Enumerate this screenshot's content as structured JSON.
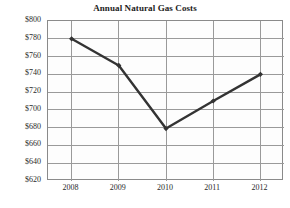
{
  "chart_data": {
    "type": "line",
    "title": "Annual Natural Gas Costs",
    "xlabel": "",
    "ylabel": "",
    "categories": [
      "2008",
      "2009",
      "2010",
      "2011",
      "2012"
    ],
    "values": [
      780,
      750,
      679,
      710,
      740
    ],
    "series": [
      {
        "name": "Annual Natural Gas Costs",
        "values": [
          780,
          750,
          679,
          710,
          740
        ]
      }
    ],
    "ylim": [
      620,
      800
    ],
    "ytick_step": 20,
    "ytick_labels": [
      "$800",
      "$780",
      "$760",
      "$740",
      "$720",
      "$700",
      "$680",
      "$660",
      "$640",
      "$620"
    ],
    "ytick_values": [
      800,
      780,
      760,
      740,
      720,
      700,
      680,
      660,
      640,
      620
    ],
    "xtick_labels": [
      "2008",
      "2009",
      "2010",
      "2011",
      "2012"
    ],
    "grid": true,
    "grid_x": true,
    "grid_y": true,
    "legend": false,
    "legend_position": "none",
    "marker": "diamond",
    "line_color": "#333333",
    "grid_color": "#9a9a9a",
    "border_color": "#8a8a8a",
    "plot_background": "#fdfdfd",
    "page_background": "#ffffff",
    "text_color": "#2a2a2a",
    "currency_prefix": "$"
  }
}
